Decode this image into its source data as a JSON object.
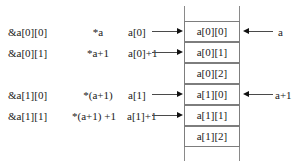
{
  "diagram": {
    "rows": [
      {
        "address_expr": "&a[0][0]",
        "deref_expr": "*a",
        "row_expr": "a[0]",
        "cell": "a[0][0]",
        "has_inbound_arrow": true
      },
      {
        "address_expr": "&a[0][1]",
        "deref_expr": "*a+1",
        "row_expr": "a[0]+1",
        "cell": "a[0][1]",
        "has_inbound_arrow": true
      },
      {
        "address_expr": "",
        "deref_expr": "",
        "row_expr": "",
        "cell": "a[0][2]",
        "has_inbound_arrow": false
      },
      {
        "address_expr": "&a[1][0]",
        "deref_expr": "*(a+1)",
        "row_expr": "a[1]",
        "cell": "a[1][0]",
        "has_inbound_arrow": true
      },
      {
        "address_expr": "&a[1][1]",
        "deref_expr": "*(a+1) +1",
        "row_expr": "a[1]+1",
        "cell": "a[1][1]",
        "has_inbound_arrow": true
      },
      {
        "address_expr": "",
        "deref_expr": "",
        "row_expr": "",
        "cell": "a[1][2]",
        "has_inbound_arrow": false
      }
    ],
    "pointer_labels": [
      {
        "label": "a",
        "target_cell": "a[0][0]"
      },
      {
        "label": "a+1",
        "target_cell": "a[1][0]"
      }
    ],
    "colors": {
      "cell_border": "#7d7d7d",
      "rail": "#8a8a8a",
      "arrow": "#111111",
      "text": "#1a1a1a",
      "background": "#ffffff"
    }
  }
}
